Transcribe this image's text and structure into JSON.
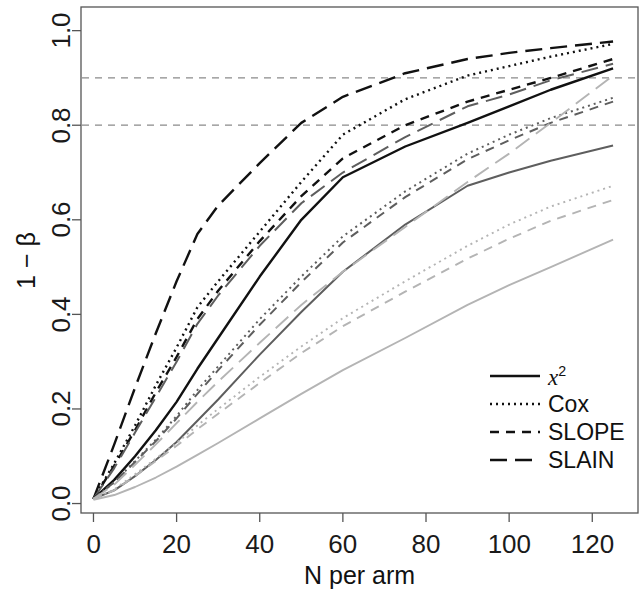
{
  "chart_data": {
    "type": "line",
    "title": "",
    "subtitle": "",
    "xlabel": "N per arm",
    "ylabel": "1 − β",
    "xlim": [
      -3,
      131
    ],
    "ylim": [
      -0.02,
      1.05
    ],
    "xticks": [
      0,
      20,
      40,
      60,
      80,
      100,
      120
    ],
    "xticklabels": [
      "0",
      "20",
      "40",
      "60",
      "80",
      "100",
      "120"
    ],
    "yticks": [
      0.0,
      0.2,
      0.4,
      0.6,
      0.8,
      1.0
    ],
    "yticklabels": [
      "0.0",
      "0.2",
      "0.4",
      "0.6",
      "0.8",
      "1.0"
    ],
    "grid": false,
    "box": true,
    "reference_lines": [
      {
        "y": 0.8,
        "style": "dashed",
        "color": "#8a8a8a",
        "label": "0.8"
      },
      {
        "y": 0.9,
        "style": "dashed",
        "color": "#8a8a8a",
        "label": "0.9"
      }
    ],
    "legend": {
      "position": "bottom-right",
      "entries": [
        {
          "label": "χ²",
          "label_base": "x",
          "label_sup": "2",
          "style": "solid",
          "dash": "none"
        },
        {
          "label": "Cox",
          "style": "dotted",
          "dash": "2,4"
        },
        {
          "label": "SLOPE",
          "style": "dashed",
          "dash": "9,7"
        },
        {
          "label": "SLAIN",
          "style": "longdash",
          "dash": "17,8"
        }
      ]
    },
    "colors": {
      "group_large": "#111111",
      "group_medium": "#5e5e5e",
      "group_small": "#b4b4b4",
      "reference": "#8a8a8a",
      "axis": "#555555"
    },
    "x": [
      0,
      5,
      10,
      15,
      20,
      25,
      30,
      40,
      50,
      60,
      75,
      90,
      100,
      110,
      125
    ],
    "series": [
      {
        "name": "SLAIN-large",
        "group": "group_large",
        "style": "longdash",
        "values": [
          0.01,
          0.125,
          0.245,
          0.36,
          0.47,
          0.57,
          0.63,
          0.72,
          0.805,
          0.86,
          0.91,
          0.94,
          0.953,
          0.963,
          0.977
        ]
      },
      {
        "name": "Cox-large",
        "group": "group_large",
        "style": "dotted",
        "values": [
          0.01,
          0.085,
          0.165,
          0.25,
          0.33,
          0.415,
          0.47,
          0.575,
          0.68,
          0.78,
          0.855,
          0.905,
          0.925,
          0.945,
          0.972
        ]
      },
      {
        "name": "SLOPE-large",
        "group": "group_large",
        "style": "dashed",
        "values": [
          0.01,
          0.08,
          0.155,
          0.235,
          0.31,
          0.39,
          0.45,
          0.555,
          0.65,
          0.73,
          0.8,
          0.85,
          0.875,
          0.9,
          0.94
        ]
      },
      {
        "name": "SLAIN-medium",
        "group": "group_medium",
        "style": "longdash",
        "values": [
          0.01,
          0.075,
          0.15,
          0.225,
          0.3,
          0.38,
          0.44,
          0.545,
          0.635,
          0.7,
          0.775,
          0.84,
          0.865,
          0.895,
          0.93
        ]
      },
      {
        "name": "chi2-large",
        "group": "group_large",
        "style": "solid",
        "values": [
          0.01,
          0.05,
          0.1,
          0.155,
          0.215,
          0.285,
          0.35,
          0.48,
          0.6,
          0.69,
          0.755,
          0.805,
          0.84,
          0.875,
          0.92
        ]
      },
      {
        "name": "Cox-medium",
        "group": "group_medium",
        "style": "dotted",
        "values": [
          0.01,
          0.045,
          0.09,
          0.135,
          0.185,
          0.24,
          0.29,
          0.39,
          0.48,
          0.565,
          0.66,
          0.74,
          0.78,
          0.815,
          0.858
        ]
      },
      {
        "name": "SLOPE-medium",
        "group": "group_medium",
        "style": "dashed",
        "values": [
          0.01,
          0.045,
          0.088,
          0.132,
          0.18,
          0.232,
          0.282,
          0.378,
          0.468,
          0.552,
          0.648,
          0.728,
          0.768,
          0.805,
          0.85
        ]
      },
      {
        "name": "chi2-medium",
        "group": "group_medium",
        "style": "solid",
        "values": [
          0.01,
          0.028,
          0.058,
          0.092,
          0.13,
          0.175,
          0.22,
          0.315,
          0.405,
          0.49,
          0.59,
          0.672,
          0.7,
          0.725,
          0.757
        ]
      },
      {
        "name": "SLAIN-small",
        "group": "group_small",
        "style": "longdash",
        "values": [
          0.01,
          0.04,
          0.082,
          0.125,
          0.17,
          0.215,
          0.258,
          0.34,
          0.42,
          0.49,
          0.585,
          0.68,
          0.74,
          0.805,
          0.905
        ]
      },
      {
        "name": "Cox-small",
        "group": "group_small",
        "style": "dotted",
        "values": [
          0.01,
          0.03,
          0.062,
          0.095,
          0.128,
          0.165,
          0.2,
          0.268,
          0.332,
          0.392,
          0.47,
          0.545,
          0.59,
          0.628,
          0.672
        ]
      },
      {
        "name": "SLOPE-small",
        "group": "group_small",
        "style": "dashed",
        "values": [
          0.01,
          0.028,
          0.058,
          0.09,
          0.122,
          0.157,
          0.19,
          0.255,
          0.318,
          0.375,
          0.448,
          0.518,
          0.56,
          0.598,
          0.642
        ]
      },
      {
        "name": "chi2-small",
        "group": "group_small",
        "style": "solid",
        "values": [
          0.008,
          0.018,
          0.035,
          0.055,
          0.078,
          0.103,
          0.128,
          0.18,
          0.232,
          0.282,
          0.35,
          0.42,
          0.462,
          0.5,
          0.558
        ]
      }
    ]
  },
  "axes": {
    "x_title": "N per arm",
    "y_title": "1 − β"
  },
  "legend": {
    "chi2_base": "x",
    "chi2_sup": "2",
    "cox": "Cox",
    "slope": "SLOPE",
    "slain": "SLAIN"
  }
}
